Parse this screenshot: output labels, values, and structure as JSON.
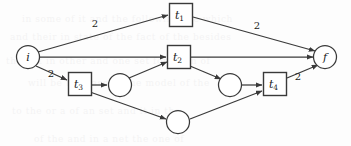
{
  "figure": {
    "kind": "petri-net-diagram",
    "width": 351,
    "height": 146,
    "background_color": "#fdfdfd",
    "stroke_color": "#3a3a3a",
    "text_color": "#1a1a1a"
  },
  "places": [
    {
      "id": "i",
      "label": "i",
      "sub": "",
      "cx": 28,
      "cy": 57,
      "r": 11.5
    },
    {
      "id": "f",
      "label": "f",
      "sub": "",
      "cx": 325,
      "cy": 57,
      "r": 11.5
    },
    {
      "id": "p1",
      "label": "",
      "sub": "",
      "cx": 120,
      "cy": 85,
      "r": 11.5
    },
    {
      "id": "p2",
      "label": "",
      "sub": "",
      "cx": 230,
      "cy": 85,
      "r": 11.5
    },
    {
      "id": "p3",
      "label": "",
      "sub": "",
      "cx": 178,
      "cy": 122,
      "r": 11.5
    }
  ],
  "transitions": [
    {
      "id": "t1",
      "label": "t",
      "sub": "1",
      "cx": 181,
      "cy": 15,
      "w": 23,
      "h": 23
    },
    {
      "id": "t2",
      "label": "t",
      "sub": "2",
      "cx": 179,
      "cy": 57,
      "w": 23,
      "h": 23
    },
    {
      "id": "t3",
      "label": "t",
      "sub": "3",
      "cx": 80,
      "cy": 84,
      "w": 23,
      "h": 23
    },
    {
      "id": "t4",
      "label": "t",
      "sub": "4",
      "cx": 275,
      "cy": 84,
      "w": 23,
      "h": 23
    }
  ],
  "arcs": [
    {
      "id": "i-t1",
      "from": "i",
      "to": "t1",
      "x1": 38,
      "y1": 52,
      "x2": 168,
      "y2": 15,
      "weight": "2",
      "wx": 95,
      "wy": 23
    },
    {
      "id": "i-t2",
      "from": "i",
      "to": "t2",
      "x1": 40,
      "y1": 57,
      "x2": 166,
      "y2": 57,
      "weight": "",
      "wx": 0,
      "wy": 0
    },
    {
      "id": "i-t3",
      "from": "i",
      "to": "t3",
      "x1": 36,
      "y1": 66,
      "x2": 67,
      "y2": 80,
      "weight": "2",
      "wx": 51,
      "wy": 73
    },
    {
      "id": "t1-f",
      "from": "t1",
      "to": "f",
      "x1": 193,
      "y1": 17,
      "x2": 315,
      "y2": 51,
      "weight": "2",
      "wx": 257,
      "wy": 25
    },
    {
      "id": "t2-f",
      "from": "t2",
      "to": "f",
      "x1": 191,
      "y1": 57,
      "x2": 313,
      "y2": 57,
      "weight": "",
      "wx": 0,
      "wy": 0
    },
    {
      "id": "t3-p1",
      "from": "t3",
      "to": "p1",
      "x1": 92,
      "y1": 85,
      "x2": 107,
      "y2": 85,
      "weight": "",
      "wx": 0,
      "wy": 0
    },
    {
      "id": "t3-p3",
      "from": "t3",
      "to": "p3",
      "x1": 90,
      "y1": 92,
      "x2": 166,
      "y2": 119,
      "weight": "",
      "wx": 0,
      "wy": 0
    },
    {
      "id": "p1-t2",
      "from": "p1",
      "to": "t2",
      "x1": 129,
      "y1": 78,
      "x2": 167,
      "y2": 62,
      "weight": "",
      "wx": 0,
      "wy": 0
    },
    {
      "id": "t2-p2",
      "from": "t2",
      "to": "p2",
      "x1": 190,
      "y1": 66,
      "x2": 221,
      "y2": 79,
      "weight": "",
      "wx": 0,
      "wy": 0
    },
    {
      "id": "p2-t4",
      "from": "p2",
      "to": "t4",
      "x1": 242,
      "y1": 85,
      "x2": 262,
      "y2": 85,
      "weight": "",
      "wx": 0,
      "wy": 0
    },
    {
      "id": "p3-t4",
      "from": "p3",
      "to": "t4",
      "x1": 190,
      "y1": 119,
      "x2": 262,
      "y2": 91,
      "weight": "",
      "wx": 0,
      "wy": 0
    },
    {
      "id": "t4-f",
      "from": "t4",
      "to": "f",
      "x1": 287,
      "y1": 78,
      "x2": 318,
      "y2": 65,
      "weight": "2",
      "wx": 298,
      "wy": 76
    }
  ],
  "weight_labels": [
    {
      "id": "w-i-t1",
      "text": "2",
      "x": 95,
      "y": 23
    },
    {
      "id": "w-i-t3",
      "text": "2",
      "x": 51,
      "y": 73
    },
    {
      "id": "w-t1-f",
      "text": "2",
      "x": 257,
      "y": 25
    },
    {
      "id": "w-t4-f",
      "text": "2",
      "x": 298,
      "y": 76
    }
  ],
  "background_bleed": [
    {
      "text": "in  some  of  it  and  the  following  the  which",
      "x": 22,
      "y": 8
    },
    {
      "text": "and  their  in  state  of  the  fact  of  the  besides",
      "x": 10,
      "y": 26
    },
    {
      "text": "the  net  in  other  and  one  set  for  them  of",
      "x": 6,
      "y": 50
    },
    {
      "text": "will  be  the  case  in  the  model  of  the",
      "x": 28,
      "y": 72
    },
    {
      "text": "to  the  or  a  of  an  set  and  it  in  the",
      "x": 12,
      "y": 100
    },
    {
      "text": "of  the  and  in  a  net  the  one  of",
      "x": 34,
      "y": 128
    }
  ]
}
